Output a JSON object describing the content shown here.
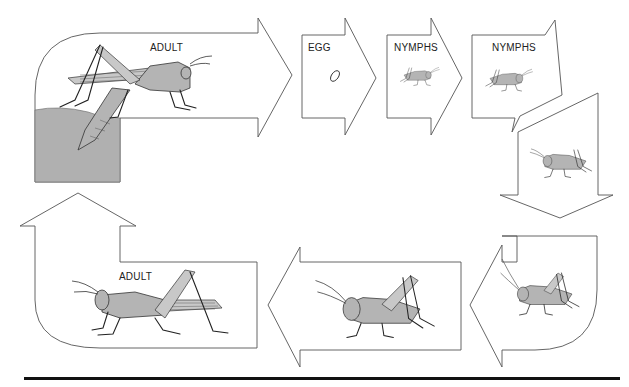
{
  "diagram": {
    "stages": [
      {
        "id": "adult-top",
        "label": "ADULT"
      },
      {
        "id": "egg",
        "label": "EGG"
      },
      {
        "id": "nymph-1",
        "label": "NYMPHS"
      },
      {
        "id": "nymph-2",
        "label": "NYMPHS"
      },
      {
        "id": "nymph-3",
        "label": ""
      },
      {
        "id": "nymph-4",
        "label": ""
      },
      {
        "id": "nymph-5",
        "label": ""
      },
      {
        "id": "adult-bottom",
        "label": "ADULT"
      }
    ],
    "colors": {
      "insect_fill": "#b4b4b4",
      "ground_fill": "#b0b0b0",
      "outline": "#555555",
      "rule": "#111111"
    }
  }
}
